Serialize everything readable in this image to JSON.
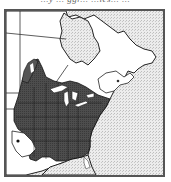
{
  "caption": "...y ... ggr... ...ies... ...",
  "map": {
    "title": "Range map – eastern North America",
    "legend": {
      "range_fill": "#4a4a4a",
      "land_fill": "#ffffff",
      "canada_fill": "#dcdcdc",
      "ocean_fill": "#e4e4e4",
      "border_color": "#222222",
      "frame_color": "#555555"
    },
    "regions": [
      {
        "name": "Hudson Bay",
        "type": "water"
      },
      {
        "name": "Atlantic Ocean",
        "type": "water"
      },
      {
        "name": "Gulf of Mexico",
        "type": "water"
      },
      {
        "name": "Great Lakes",
        "type": "water"
      },
      {
        "name": "Species range (eastern US)",
        "type": "range"
      }
    ]
  }
}
